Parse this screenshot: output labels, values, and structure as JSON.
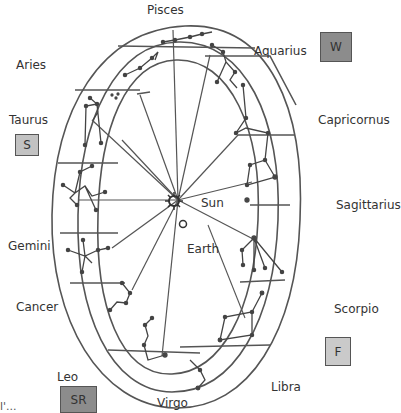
{
  "diagram": {
    "center": {
      "sun_label": "Sun",
      "earth_label": "Earth"
    },
    "constellations": [
      {
        "name": "Pisces",
        "x": 170,
        "y": 2
      },
      {
        "name": "Aquarius",
        "x": 254,
        "y": 45
      },
      {
        "name": "Aries",
        "x": 16,
        "y": 58
      },
      {
        "name": "Capricornus",
        "x": 317,
        "y": 112
      },
      {
        "name": "Taurus",
        "x": 8,
        "y": 113
      },
      {
        "name": "Sagittarius",
        "x": 336,
        "y": 199
      },
      {
        "name": "Gemini",
        "x": 6,
        "y": 239
      },
      {
        "name": "Cancer",
        "x": 15,
        "y": 301
      },
      {
        "name": "Scorpio",
        "x": 334,
        "y": 301
      },
      {
        "name": "Leo",
        "x": 58,
        "y": 370
      },
      {
        "name": "Libra",
        "x": 270,
        "y": 378
      },
      {
        "name": "Virgo",
        "x": 157,
        "y": 396
      }
    ],
    "season_boxes": [
      {
        "id": "W",
        "label": "W",
        "x": 320,
        "y": 32,
        "w": 32,
        "h": 30,
        "color": "#8c8c8c"
      },
      {
        "id": "S",
        "label": "S",
        "x": 15,
        "y": 134,
        "w": 24,
        "h": 22,
        "color": "#c2c2c2"
      },
      {
        "id": "F",
        "label": "F",
        "x": 325,
        "y": 337,
        "w": 26,
        "h": 29,
        "color": "#cacaca"
      },
      {
        "id": "SR",
        "label": "SR",
        "x": 60,
        "y": 386,
        "w": 37,
        "h": 27,
        "color": "#8c8c8c"
      }
    ],
    "footer_fragment": "l'..."
  }
}
